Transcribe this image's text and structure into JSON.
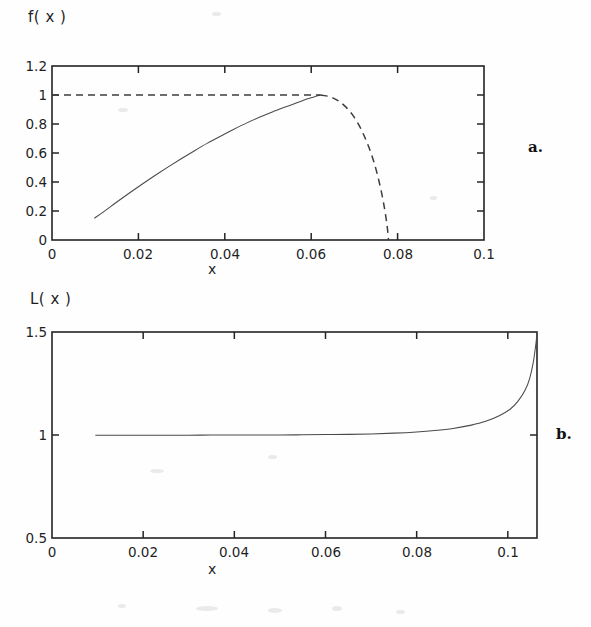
{
  "page": {
    "background_color": "#fefefe",
    "ink_color": "#242424"
  },
  "figures": [
    {
      "id": "panel-a",
      "panel_letter": "a.",
      "ylabel": "f( x )",
      "xlabel": "x"
    },
    {
      "id": "panel-b",
      "panel_letter": "b.",
      "ylabel": "L( x )",
      "xlabel": "x"
    }
  ],
  "chart_data": [
    {
      "type": "line",
      "id": "panel-a",
      "title": "",
      "panel_letter": "a.",
      "xlabel": "x",
      "ylabel": "f( x )",
      "xlim": [
        0,
        0.1
      ],
      "ylim": [
        0,
        1.2
      ],
      "xticks": [
        0,
        0.02,
        0.04,
        0.06,
        0.08,
        0.1
      ],
      "xticklabels": [
        "0",
        "0.02",
        "0.04",
        "0.06",
        "0.08",
        "0.1"
      ],
      "yticks": [
        0,
        0.2,
        0.4,
        0.6,
        0.8,
        1,
        1.2
      ],
      "yticklabels": [
        "0",
        "0.2",
        "0.4",
        "0.6",
        "0.8",
        "1",
        "1.2"
      ],
      "grid": false,
      "legend": "none",
      "series": [
        {
          "name": "f(x) stable branch",
          "style": "solid",
          "color": "#4a4a4a",
          "x": [
            0.0098,
            0.012,
            0.015,
            0.018,
            0.021,
            0.024,
            0.027,
            0.03,
            0.033,
            0.036,
            0.039,
            0.042,
            0.045,
            0.048,
            0.051,
            0.054,
            0.057,
            0.059,
            0.0605,
            0.0615,
            0.0622
          ],
          "y": [
            0.15,
            0.196,
            0.262,
            0.326,
            0.388,
            0.448,
            0.506,
            0.562,
            0.616,
            0.668,
            0.716,
            0.762,
            0.806,
            0.846,
            0.883,
            0.917,
            0.95,
            0.972,
            0.985,
            0.995,
            1.0
          ]
        },
        {
          "name": "f(x) = 1 reference",
          "style": "dashed",
          "color": "#3d3d3d",
          "x": [
            0.0,
            0.0622
          ],
          "y": [
            1.0,
            1.0
          ]
        },
        {
          "name": "f(x) unstable branch",
          "style": "dashed",
          "color": "#3d3d3d",
          "x": [
            0.0622,
            0.0635,
            0.065,
            0.0665,
            0.068,
            0.0695,
            0.071,
            0.0722,
            0.0734,
            0.0745,
            0.0755,
            0.0764,
            0.0771,
            0.0776,
            0.0779
          ],
          "y": [
            1.0,
            0.994,
            0.98,
            0.955,
            0.918,
            0.866,
            0.795,
            0.722,
            0.636,
            0.54,
            0.43,
            0.31,
            0.195,
            0.09,
            0.0
          ]
        }
      ]
    },
    {
      "type": "line",
      "id": "panel-b",
      "title": "",
      "panel_letter": "b.",
      "xlabel": "x",
      "ylabel": "L( x )",
      "xlim": [
        0,
        0.1064
      ],
      "ylim": [
        0.5,
        1.5
      ],
      "xticks": [
        0,
        0.02,
        0.04,
        0.06,
        0.08,
        0.1
      ],
      "xticklabels": [
        "0",
        "0.02",
        "0.04",
        "0.06",
        "0.08",
        "0.1"
      ],
      "yticks": [
        0.5,
        1,
        1.5
      ],
      "yticklabels": [
        "0.5",
        "1",
        "1.5"
      ],
      "grid": false,
      "legend": "none",
      "series": [
        {
          "name": "L(x)",
          "style": "solid",
          "color": "#4a4a4a",
          "x": [
            0.0095,
            0.015,
            0.02,
            0.025,
            0.03,
            0.035,
            0.04,
            0.045,
            0.05,
            0.055,
            0.06,
            0.065,
            0.07,
            0.075,
            0.08,
            0.084,
            0.088,
            0.092,
            0.095,
            0.098,
            0.1005,
            0.1022,
            0.1038,
            0.1048,
            0.1056,
            0.1062,
            0.1064
          ],
          "y": [
            0.999,
            0.999,
            0.999,
            0.999,
            0.999,
            1.0,
            1.0,
            1.0,
            1.0,
            1.001,
            1.002,
            1.003,
            1.005,
            1.009,
            1.015,
            1.022,
            1.032,
            1.048,
            1.065,
            1.092,
            1.125,
            1.163,
            1.218,
            1.275,
            1.355,
            1.45,
            1.5
          ]
        }
      ]
    }
  ]
}
